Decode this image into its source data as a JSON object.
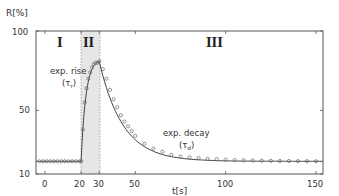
{
  "chart_data": {
    "type": "line",
    "title": "",
    "xlabel": "t[s]",
    "ylabel": "R[%]",
    "xlim": [
      -5,
      155
    ],
    "ylim": [
      10,
      100
    ],
    "x_ticks": [
      0,
      20,
      30,
      50,
      100,
      150
    ],
    "y_ticks": [
      10,
      50,
      100
    ],
    "grid": false,
    "legend": null,
    "regions": [
      {
        "label": "I",
        "x_start": -5,
        "x_end": 20,
        "shaded": false
      },
      {
        "label": "II",
        "x_start": 20,
        "x_end": 30,
        "shaded": true
      },
      {
        "label": "III",
        "x_start": 30,
        "x_end": 155,
        "shaded": false
      }
    ],
    "annotations": [
      {
        "text": "exp. rise",
        "sub": "(τr)",
        "x": 12,
        "y": 68
      },
      {
        "text": "exp. decay",
        "sub": "(τd)",
        "x": 68,
        "y": 30
      }
    ],
    "series": [
      {
        "name": "measured (markers)",
        "marker": "circle",
        "x": [
          -3,
          -1,
          1,
          3,
          5,
          7,
          9,
          11,
          13,
          15,
          17,
          19,
          20,
          21,
          22,
          23,
          24,
          25,
          26,
          27,
          28,
          29,
          30,
          32,
          34,
          36,
          38,
          40,
          42,
          44,
          46,
          48,
          50,
          55,
          60,
          65,
          70,
          75,
          80,
          85,
          90,
          95,
          100,
          105,
          110,
          115,
          120,
          125,
          130,
          135,
          140,
          145,
          150
        ],
        "y": [
          18,
          18,
          18,
          18,
          18,
          18,
          18,
          18,
          18,
          18,
          18,
          18,
          18,
          38,
          55,
          64,
          70,
          74,
          77,
          79,
          80,
          80,
          81,
          76,
          70,
          63,
          57,
          52,
          47,
          43,
          40,
          37,
          34,
          29,
          26,
          24,
          22,
          21,
          20.5,
          20,
          19.5,
          19.3,
          19,
          18.8,
          18.6,
          18.5,
          18.4,
          18.3,
          18.2,
          18.2,
          18.1,
          18.1,
          18
        ]
      },
      {
        "name": "exponential fit",
        "marker": "none",
        "tau_rise_label": "τr",
        "tau_decay_label": "τd"
      }
    ]
  },
  "axes": {
    "ylabel": "R[%]",
    "xlabel": "t[s]",
    "y_tick_labels": [
      "100",
      "50",
      "10"
    ],
    "x_tick_labels": [
      "0",
      "20",
      "30",
      "50",
      "100",
      "150"
    ]
  },
  "regions": {
    "r1": "I",
    "r2": "II",
    "r3": "III"
  },
  "annotations": {
    "rise_line1": "exp. rise",
    "rise_tau": "τ",
    "rise_sub": "r",
    "decay_line1": "exp. decay",
    "decay_tau": "τ",
    "decay_sub": "d"
  }
}
